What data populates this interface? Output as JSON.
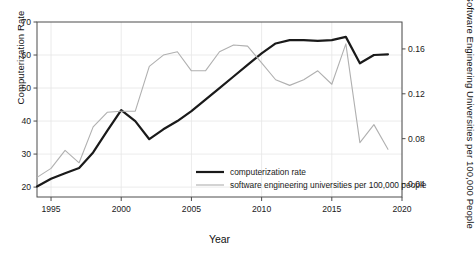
{
  "chart_data": {
    "type": "line",
    "title": "",
    "xlabel": "Year",
    "ylabel": "Computerization Rate",
    "ylabel_right": "Software Engineering Universities per 100,000 People",
    "xlim": [
      1994,
      2020
    ],
    "ylim": [
      17,
      70
    ],
    "ylim_right": [
      0.028,
      0.184
    ],
    "grid": true,
    "legend_position": "inside-bottom-center",
    "xticks": [
      1995,
      2000,
      2005,
      2010,
      2015,
      2020
    ],
    "xtick_labels": [
      "1995",
      "2000",
      "2005",
      "2010",
      "2015",
      "2020"
    ],
    "yticks": [
      20,
      30,
      40,
      50,
      60,
      70
    ],
    "ytick_labels": [
      "20",
      "30",
      "40",
      "50",
      "60",
      "70"
    ],
    "yticks_right": [
      0.04,
      0.08,
      0.12,
      0.16
    ],
    "ytick_labels_right": [
      "0.04",
      "0.08",
      "0.12",
      "0.16"
    ],
    "x": [
      1994,
      1995,
      1996,
      1997,
      1998,
      1999,
      2000,
      2001,
      2002,
      2003,
      2004,
      2005,
      2006,
      2007,
      2008,
      2009,
      2010,
      2011,
      2012,
      2013,
      2014,
      2015,
      2016,
      2017,
      2018,
      2019
    ],
    "series": [
      {
        "name": "computerization rate",
        "axis": "left",
        "color": "#1a1a1a",
        "width": 2.2,
        "values": [
          20.2,
          22.5,
          24.2,
          25.8,
          30.5,
          37.0,
          43.3,
          40.0,
          34.5,
          37.5,
          40.0,
          43.0,
          46.5,
          50.0,
          53.5,
          57.0,
          60.5,
          63.5,
          64.5,
          64.5,
          64.3,
          64.5,
          65.5,
          57.5,
          60.0,
          60.2
        ]
      },
      {
        "name": "software engineering universities per 100,000 people",
        "axis": "right",
        "color": "#b0b0b0",
        "width": 1.1,
        "values": [
          0.0455,
          0.0535,
          0.0695,
          0.0585,
          0.0905,
          0.1035,
          0.1045,
          0.1045,
          0.1445,
          0.1545,
          0.1575,
          0.1405,
          0.1405,
          0.1575,
          0.1635,
          0.1625,
          0.1475,
          0.1325,
          0.1275,
          0.1325,
          0.1405,
          0.1285,
          0.1645,
          0.0765,
          0.0925,
          0.0705
        ]
      }
    ]
  },
  "legend": {
    "entries": [
      {
        "label": "computerization rate",
        "color": "#1a1a1a",
        "width": 2.2
      },
      {
        "label": "software engineering universities per 100,000 people",
        "color": "#b0b0b0",
        "width": 1.1
      }
    ]
  },
  "axes": {
    "left_title": "Computerization Rate",
    "right_title": "Software Engineering Universities per 100,000 People",
    "bottom_title": "Year"
  }
}
